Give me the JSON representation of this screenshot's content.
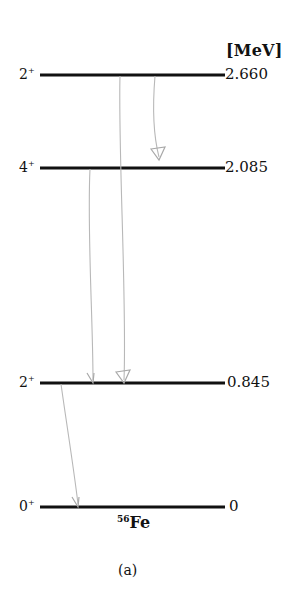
{
  "unit_label": "[MeV]",
  "nucleus": {
    "mass_number": "56",
    "symbol": "Fe"
  },
  "caption": "(a)",
  "levels": [
    {
      "spin": "2",
      "parity": "+",
      "energy": "2.660",
      "energy_mev": 2.66
    },
    {
      "spin": "4",
      "parity": "+",
      "energy": "2.085",
      "energy_mev": 2.085
    },
    {
      "spin": "2",
      "parity": "+",
      "energy": "0.845",
      "energy_mev": 0.845
    },
    {
      "spin": "0",
      "parity": "+",
      "energy": "0",
      "energy_mev": 0
    }
  ],
  "transitions": [
    {
      "from": "2.660",
      "to": "2.085",
      "head": "open-triangle"
    },
    {
      "from": "2.660",
      "to": "0.845",
      "head": "open-triangle"
    },
    {
      "from": "2.085",
      "to": "0.845",
      "head": "chevron"
    },
    {
      "from": "0.845",
      "to": "0",
      "head": "chevron"
    }
  ],
  "colors": {
    "level_line": "#111111",
    "transition_line": "#b8b8b8"
  }
}
